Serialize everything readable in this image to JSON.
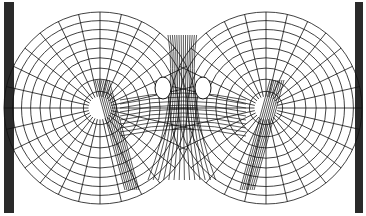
{
  "diagram": {
    "type": "finite-element-mesh",
    "left_bar": {
      "x": 4,
      "width": 10,
      "color": "#2a2a2a"
    },
    "right_bar": {
      "x": 355,
      "width": 8,
      "color": "#2a2a2a"
    },
    "circles": [
      {
        "cx": 100,
        "cy": 108,
        "r": 96
      },
      {
        "cx": 266,
        "cy": 108,
        "r": 96
      }
    ],
    "holes": [
      {
        "cx": 163,
        "cy": 88,
        "rx": 8,
        "ry": 11
      },
      {
        "cx": 203,
        "cy": 88,
        "rx": 8,
        "ry": 11
      }
    ],
    "line_color": "#111111",
    "rings": 9,
    "spokes": 28
  }
}
